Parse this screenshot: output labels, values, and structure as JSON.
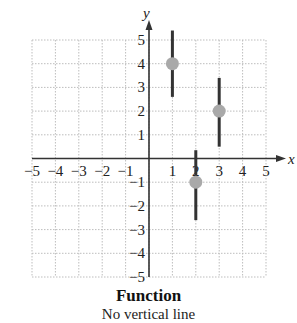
{
  "chart_data": {
    "type": "scatter",
    "title": "Function",
    "subtitle": "No vertical line",
    "xlabel": "x",
    "ylabel": "y",
    "xlim": [
      -5,
      5
    ],
    "ylim": [
      -5,
      5
    ],
    "grid": true,
    "x_ticks": [
      -5,
      -4,
      -3,
      -2,
      -1,
      1,
      2,
      3,
      4,
      5
    ],
    "y_ticks": [
      -5,
      -4,
      -3,
      -2,
      -1,
      1,
      2,
      3,
      4,
      5
    ],
    "x_tick_labels": [
      "−5",
      "−4",
      "−3",
      "−2",
      "−1",
      "1",
      "2",
      "3",
      "4",
      "5"
    ],
    "y_tick_labels": [
      "−5",
      "−4",
      "−3",
      "−2",
      "−1",
      "1",
      "2",
      "3",
      "4",
      "5"
    ],
    "points": [
      {
        "x": 1,
        "y": 4
      },
      {
        "x": 3,
        "y": 2
      },
      {
        "x": 2,
        "y": -1
      }
    ],
    "vertical_line_tests": [
      {
        "x": 1,
        "y_from": 2.6,
        "y_to": 5.4
      },
      {
        "x": 3,
        "y_from": 0.5,
        "y_to": 3.4
      },
      {
        "x": 2,
        "y_from": -2.6,
        "y_to": 0.35
      }
    ],
    "colors": {
      "point": "#a9a9a9",
      "line": "#333333",
      "axis": "#333333",
      "grid": "#bdbdbd"
    }
  }
}
